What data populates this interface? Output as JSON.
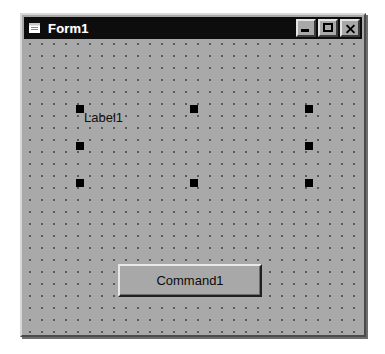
{
  "window": {
    "title": "Form1",
    "icon": "vb-form-icon",
    "colors": {
      "titlebar_bg": "#0d0d0d",
      "titlebar_text": "#ffffff",
      "form_face": "#a8a8a8",
      "grid_dot": "#5a5a5a",
      "handle": "#000000",
      "page_bg": "#ffffff"
    },
    "caption_buttons": [
      {
        "name": "minimize",
        "label": "Minimize",
        "glyph": "minimize-icon"
      },
      {
        "name": "maximize",
        "label": "Maximize",
        "glyph": "maximize-icon"
      },
      {
        "name": "close",
        "label": "Close",
        "glyph": "close-icon"
      }
    ]
  },
  "designer": {
    "grid": {
      "visible": true,
      "spacing_px": 12
    },
    "controls": [
      {
        "type": "Label",
        "name": "Label1",
        "caption": "Label1",
        "selected": true,
        "bounds": {
          "x": 56,
          "y": 70,
          "width": 237,
          "height": 82
        }
      },
      {
        "type": "CommandButton",
        "name": "Command1",
        "caption": "Command1",
        "selected": false,
        "bounds": {
          "x": 94,
          "y": 225,
          "width": 144,
          "height": 33
        }
      }
    ],
    "selection_handles": [
      {
        "position": "top-left",
        "x": 0,
        "y": 0
      },
      {
        "position": "top-center",
        "x": 114,
        "y": 0
      },
      {
        "position": "top-right",
        "x": 229,
        "y": 0
      },
      {
        "position": "middle-left",
        "x": 0,
        "y": 37
      },
      {
        "position": "middle-right",
        "x": 229,
        "y": 37
      },
      {
        "position": "bottom-left",
        "x": 0,
        "y": 74
      },
      {
        "position": "bottom-center",
        "x": 114,
        "y": 74
      },
      {
        "position": "bottom-right",
        "x": 229,
        "y": 74
      }
    ]
  }
}
